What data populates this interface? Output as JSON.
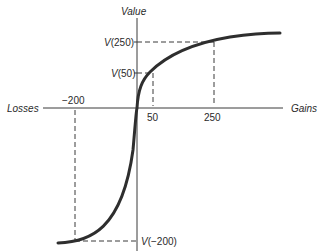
{
  "diagram": {
    "type": "prospect-theory-value-function",
    "axes": {
      "y_label": "Value",
      "x_left_label": "Losses",
      "x_right_label": "Gains"
    },
    "x_ticks": [
      {
        "label": "−200",
        "value": -200
      },
      {
        "label": "50",
        "value": 50
      },
      {
        "label": "250",
        "value": 250
      }
    ],
    "y_markers": [
      {
        "prefix": "V",
        "arg": "(250)"
      },
      {
        "prefix": "V",
        "arg": "(50)"
      },
      {
        "prefix": "V",
        "arg": "(−200)"
      }
    ],
    "colors": {
      "curve": "#2e2e2e",
      "axes": "#3a3a3a",
      "dashes": "#3a3a3a",
      "text": "#2a2a2a"
    }
  }
}
